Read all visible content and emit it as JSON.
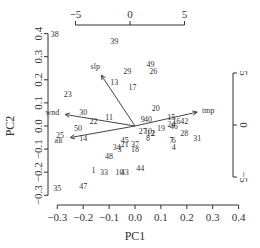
{
  "chart_data": {
    "type": "scatter",
    "subtype": "biplot",
    "title": "",
    "xlabel": "PC1",
    "ylabel": "PC2",
    "xlim": [
      -0.33,
      0.42
    ],
    "ylim": [
      -0.34,
      0.42
    ],
    "x_ticks": [
      "-0.3",
      "-0.2",
      "-0.1",
      "0.0",
      "0.1",
      "0.2",
      "0.3",
      "0.4"
    ],
    "y_ticks": [
      "-0.3",
      "-0.2",
      "-0.1",
      "0.0",
      "0.1",
      "0.2",
      "0.3",
      "0.4"
    ],
    "top_axis_ticks": [
      "-5",
      "0",
      "5"
    ],
    "right_axis_ticks": [
      "5",
      "0",
      "-5"
    ],
    "grid": false,
    "legend": null,
    "points": [
      {
        "label": "38",
        "x": -0.31,
        "y": 0.4
      },
      {
        "label": "39",
        "x": -0.08,
        "y": 0.37
      },
      {
        "label": "49",
        "x": 0.06,
        "y": 0.27
      },
      {
        "label": "26",
        "x": 0.07,
        "y": 0.24
      },
      {
        "label": "29",
        "x": -0.03,
        "y": 0.24
      },
      {
        "label": "13",
        "x": -0.08,
        "y": 0.19
      },
      {
        "label": "17",
        "x": -0.01,
        "y": 0.17
      },
      {
        "label": "23",
        "x": -0.26,
        "y": 0.14
      },
      {
        "label": "30",
        "x": -0.2,
        "y": 0.06
      },
      {
        "label": "11",
        "x": -0.1,
        "y": 0.04
      },
      {
        "label": "20",
        "x": 0.08,
        "y": 0.08
      },
      {
        "label": "15",
        "x": 0.14,
        "y": 0.04
      },
      {
        "label": "22",
        "x": -0.16,
        "y": 0.02
      },
      {
        "label": "50",
        "x": -0.22,
        "y": -0.01
      },
      {
        "label": "25",
        "x": -0.29,
        "y": -0.04
      },
      {
        "label": "14",
        "x": -0.2,
        "y": -0.05
      },
      {
        "label": "9",
        "x": 0.03,
        "y": 0.03
      },
      {
        "label": "40",
        "x": 0.05,
        "y": 0.03
      },
      {
        "label": "16",
        "x": 0.16,
        "y": 0.02
      },
      {
        "label": "42",
        "x": 0.19,
        "y": 0.02
      },
      {
        "label": "24",
        "x": 0.14,
        "y": 0.01
      },
      {
        "label": "46",
        "x": 0.15,
        "y": 0.0
      },
      {
        "label": "19",
        "x": 0.1,
        "y": -0.01
      },
      {
        "label": "27",
        "x": 0.03,
        "y": -0.02
      },
      {
        "label": "10",
        "x": 0.05,
        "y": -0.02
      },
      {
        "label": "12",
        "x": 0.06,
        "y": -0.03
      },
      {
        "label": "2",
        "x": 0.07,
        "y": -0.03
      },
      {
        "label": "8",
        "x": 0.05,
        "y": -0.05
      },
      {
        "label": "28",
        "x": 0.19,
        "y": -0.03
      },
      {
        "label": "31",
        "x": 0.24,
        "y": -0.05
      },
      {
        "label": "7",
        "x": 0.14,
        "y": -0.06
      },
      {
        "label": "6",
        "x": 0.15,
        "y": -0.06
      },
      {
        "label": "4",
        "x": 0.15,
        "y": -0.09
      },
      {
        "label": "45",
        "x": -0.04,
        "y": -0.06
      },
      {
        "label": "21",
        "x": -0.04,
        "y": -0.08
      },
      {
        "label": "34",
        "x": -0.07,
        "y": -0.09
      },
      {
        "label": "3",
        "x": -0.06,
        "y": -0.1
      },
      {
        "label": "37",
        "x": 0.0,
        "y": -0.08
      },
      {
        "label": "18",
        "x": -0.0,
        "y": -0.1
      },
      {
        "label": "48",
        "x": -0.1,
        "y": -0.13
      },
      {
        "label": "1",
        "x": -0.16,
        "y": -0.19
      },
      {
        "label": "33",
        "x": -0.12,
        "y": -0.2
      },
      {
        "label": "10",
        "x": -0.06,
        "y": -0.2
      },
      {
        "label": "43",
        "x": -0.04,
        "y": -0.2
      },
      {
        "label": "44",
        "x": 0.02,
        "y": -0.18
      },
      {
        "label": "35",
        "x": -0.3,
        "y": -0.27
      },
      {
        "label": "47",
        "x": -0.2,
        "y": -0.26
      }
    ],
    "loadings": [
      {
        "variable": "slp",
        "x": -0.13,
        "y": 0.22
      },
      {
        "variable": "wnd",
        "x": -0.27,
        "y": 0.05
      },
      {
        "variable": "alt",
        "x": -0.25,
        "y": -0.05
      },
      {
        "variable": "tmp",
        "x": 0.24,
        "y": 0.06
      }
    ]
  }
}
